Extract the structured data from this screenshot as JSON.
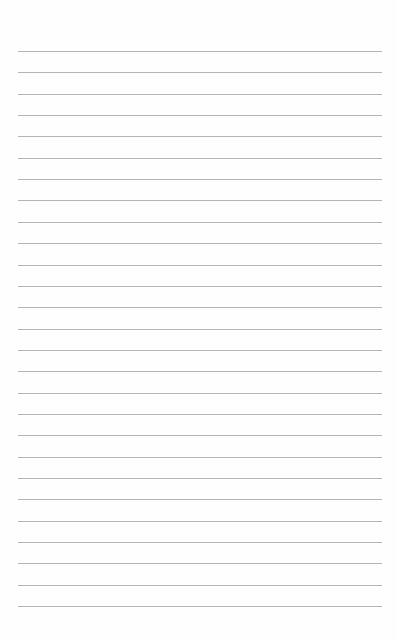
{
  "page": {
    "type": "lined-paper",
    "line_count": 27,
    "first_line_y": 51,
    "line_spacing": 21.35,
    "line_left": 18,
    "line_width": 364,
    "line_color": "#b4b4b4",
    "background_color": "#fefefe"
  }
}
